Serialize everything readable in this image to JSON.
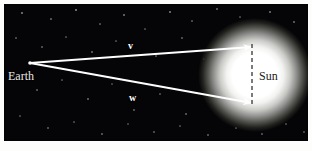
{
  "figure": {
    "kind": "astronomy-vector-diagram",
    "width": 312,
    "height": 151,
    "background_color": "#fdfdfc",
    "plate_color": "#050406"
  },
  "labels": {
    "earth": "Earth",
    "sun": "Sun",
    "vector_v": "v",
    "vector_w": "w"
  },
  "colors": {
    "ray": "#ffffff",
    "sun_core": "#ffffff",
    "dashed_line": "#3a3a38",
    "star": "#cfd3de",
    "earth_text": "#e8e8e8",
    "sun_text": "#1a1a18"
  },
  "geometry": {
    "earth_point": {
      "x": 26,
      "y": 59
    },
    "sun_center": {
      "x": 251,
      "y": 71
    },
    "sun_core_radius": 34,
    "sun_halo_radius": 57,
    "vector_v_tip": {
      "x": 248,
      "y": 43
    },
    "vector_w_tip": {
      "x": 248,
      "y": 99
    },
    "diameter_line": {
      "x": 248,
      "y_top": 40,
      "y_bottom": 103
    }
  },
  "stars": [
    {
      "x": 18,
      "y": 9,
      "r": 0.7,
      "o": 0.55
    },
    {
      "x": 47,
      "y": 15,
      "r": 0.6,
      "o": 0.4
    },
    {
      "x": 72,
      "y": 6,
      "r": 0.8,
      "o": 0.6
    },
    {
      "x": 96,
      "y": 20,
      "r": 0.6,
      "o": 0.35
    },
    {
      "x": 120,
      "y": 11,
      "r": 0.7,
      "o": 0.5
    },
    {
      "x": 141,
      "y": 25,
      "r": 0.6,
      "o": 0.3
    },
    {
      "x": 166,
      "y": 8,
      "r": 0.8,
      "o": 0.55
    },
    {
      "x": 188,
      "y": 17,
      "r": 0.6,
      "o": 0.35
    },
    {
      "x": 213,
      "y": 5,
      "r": 0.7,
      "o": 0.45
    },
    {
      "x": 236,
      "y": 13,
      "r": 0.6,
      "o": 0.3
    },
    {
      "x": 266,
      "y": 8,
      "r": 0.8,
      "o": 0.5
    },
    {
      "x": 290,
      "y": 18,
      "r": 0.7,
      "o": 0.45
    },
    {
      "x": 12,
      "y": 34,
      "r": 0.6,
      "o": 0.35
    },
    {
      "x": 38,
      "y": 43,
      "r": 0.7,
      "o": 0.4
    },
    {
      "x": 62,
      "y": 33,
      "r": 0.6,
      "o": 0.3
    },
    {
      "x": 88,
      "y": 48,
      "r": 0.7,
      "o": 0.45
    },
    {
      "x": 112,
      "y": 37,
      "r": 0.6,
      "o": 0.3
    },
    {
      "x": 152,
      "y": 52,
      "r": 0.6,
      "o": 0.35
    },
    {
      "x": 178,
      "y": 34,
      "r": 0.7,
      "o": 0.4
    },
    {
      "x": 200,
      "y": 55,
      "r": 0.6,
      "o": 0.28
    },
    {
      "x": 294,
      "y": 44,
      "r": 0.7,
      "o": 0.45
    },
    {
      "x": 300,
      "y": 62,
      "r": 0.6,
      "o": 0.35
    },
    {
      "x": 10,
      "y": 70,
      "r": 0.6,
      "o": 0.3
    },
    {
      "x": 33,
      "y": 86,
      "r": 0.7,
      "o": 0.4
    },
    {
      "x": 58,
      "y": 76,
      "r": 0.6,
      "o": 0.3
    },
    {
      "x": 84,
      "y": 95,
      "r": 0.7,
      "o": 0.45
    },
    {
      "x": 108,
      "y": 80,
      "r": 0.6,
      "o": 0.28
    },
    {
      "x": 130,
      "y": 106,
      "r": 0.7,
      "o": 0.4
    },
    {
      "x": 156,
      "y": 90,
      "r": 0.6,
      "o": 0.32
    },
    {
      "x": 182,
      "y": 110,
      "r": 0.7,
      "o": 0.42
    },
    {
      "x": 206,
      "y": 98,
      "r": 0.6,
      "o": 0.3
    },
    {
      "x": 296,
      "y": 92,
      "r": 0.7,
      "o": 0.4
    },
    {
      "x": 16,
      "y": 112,
      "r": 0.6,
      "o": 0.3
    },
    {
      "x": 44,
      "y": 124,
      "r": 0.7,
      "o": 0.4
    },
    {
      "x": 70,
      "y": 118,
      "r": 0.6,
      "o": 0.3
    },
    {
      "x": 98,
      "y": 130,
      "r": 0.7,
      "o": 0.42
    },
    {
      "x": 124,
      "y": 120,
      "r": 0.6,
      "o": 0.28
    },
    {
      "x": 150,
      "y": 128,
      "r": 0.7,
      "o": 0.38
    },
    {
      "x": 176,
      "y": 122,
      "r": 0.6,
      "o": 0.3
    },
    {
      "x": 204,
      "y": 131,
      "r": 0.7,
      "o": 0.4
    },
    {
      "x": 232,
      "y": 124,
      "r": 0.6,
      "o": 0.3
    },
    {
      "x": 258,
      "y": 130,
      "r": 0.7,
      "o": 0.38
    },
    {
      "x": 282,
      "y": 120,
      "r": 0.6,
      "o": 0.3
    },
    {
      "x": 300,
      "y": 128,
      "r": 0.7,
      "o": 0.35
    }
  ]
}
